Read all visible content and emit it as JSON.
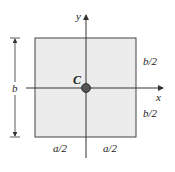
{
  "diagram": {
    "type": "rectangle-cross-section",
    "rect": {
      "fill": "#ececec",
      "stroke": "#444444"
    },
    "axes": {
      "x_label": "x",
      "y_label": "y"
    },
    "centroid": {
      "label": "C",
      "fill": "#555555"
    },
    "dimensions": {
      "height_label": "b",
      "upper_half_label": "b/2",
      "lower_half_label": "b/2",
      "left_half_label": "a/2",
      "right_half_label": "a/2"
    }
  }
}
